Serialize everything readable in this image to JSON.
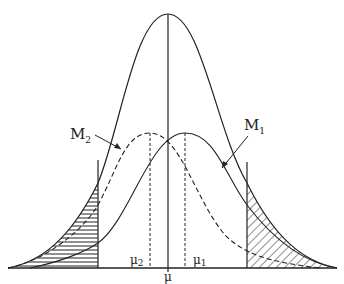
{
  "labels": {
    "M1": {
      "base": "M",
      "sub": "1"
    },
    "M2": {
      "base": "M",
      "sub": "2"
    },
    "mu": "μ",
    "mu1": {
      "base": "μ",
      "sub": "1"
    },
    "mu2": {
      "base": "μ",
      "sub": "2"
    }
  },
  "curves": {
    "main": {
      "style": "solid",
      "peak_x": 168,
      "peak_y": 14,
      "description": "large central normal curve"
    },
    "M1": {
      "style": "solid",
      "peak_x": 185,
      "peak_y": 133,
      "description": "curve centered at mu1"
    },
    "M2": {
      "style": "dashed",
      "peak_x": 150,
      "peak_y": 133,
      "description": "curve centered at mu2"
    }
  },
  "regions": {
    "left_tail": {
      "fill": "horizontal-hatch",
      "boundary_x": 98
    },
    "right_tail": {
      "fill": "diagonal-hatch",
      "boundary_x": 247
    }
  },
  "colors": {
    "line": "#222222",
    "background": "#ffffff"
  }
}
